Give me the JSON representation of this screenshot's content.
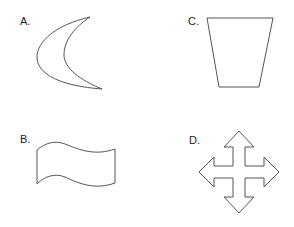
{
  "figure": {
    "options": [
      {
        "key": "A",
        "label": "A.",
        "shape": "crescent"
      },
      {
        "key": "B",
        "label": "B.",
        "shape": "wavy-banner"
      },
      {
        "key": "C",
        "label": "C.",
        "shape": "trapezoid"
      },
      {
        "key": "D",
        "label": "D.",
        "shape": "four-way-arrow"
      }
    ],
    "colors": {
      "stroke": "#555555",
      "fill": "#ffffff",
      "text": "#222222"
    }
  }
}
